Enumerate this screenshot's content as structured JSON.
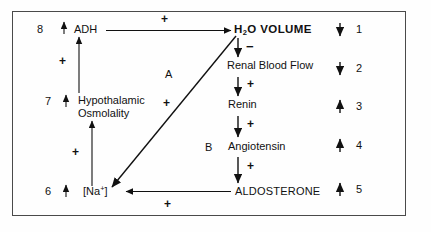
{
  "diagram": {
    "frame_color": "#4a4a4a",
    "nodes": {
      "adh": "ADH",
      "osmolality_line1": "Hypothalamic",
      "osmolality_line2": "Osmolality",
      "sodium_text": "[Na",
      "sodium_sup": "+",
      "sodium_close": "]",
      "h2o_volume_h": "H",
      "h2o_volume_sub": "2",
      "h2o_volume_rest": "O VOLUME",
      "renal_blood_flow": "Renal Blood Flow",
      "renin": "Renin",
      "angiotensin": "Angiotensin",
      "aldosterone": "ALDOSTERONE"
    },
    "pathway_labels": {
      "a": "A",
      "b": "B"
    },
    "signs": {
      "adh_to_h2o": "+",
      "osmolality_to_adh": "+",
      "sodium_to_osmolality": "+",
      "h2o_to_renal": "−",
      "renal_to_renin": "+",
      "renin_to_angiotensin": "+",
      "angiotensin_to_aldosterone": "+",
      "aldosterone_to_sodium": "+",
      "diagonal_sign": "+"
    },
    "left_numbers": [
      {
        "number": "8",
        "direction": "up",
        "node": "ADH"
      },
      {
        "number": "7",
        "direction": "up",
        "node": "Hypothalamic Osmolality"
      },
      {
        "number": "6",
        "direction": "up",
        "node": "[Na+]"
      }
    ],
    "right_numbers": [
      {
        "number": "1",
        "direction": "down",
        "node": "H2O VOLUME"
      },
      {
        "number": "2",
        "direction": "down",
        "node": "Renal Blood Flow"
      },
      {
        "number": "3",
        "direction": "up",
        "node": "Renin"
      },
      {
        "number": "4",
        "direction": "up",
        "node": "Angiotensin"
      },
      {
        "number": "5",
        "direction": "up",
        "node": "ALDOSTERONE"
      }
    ]
  }
}
